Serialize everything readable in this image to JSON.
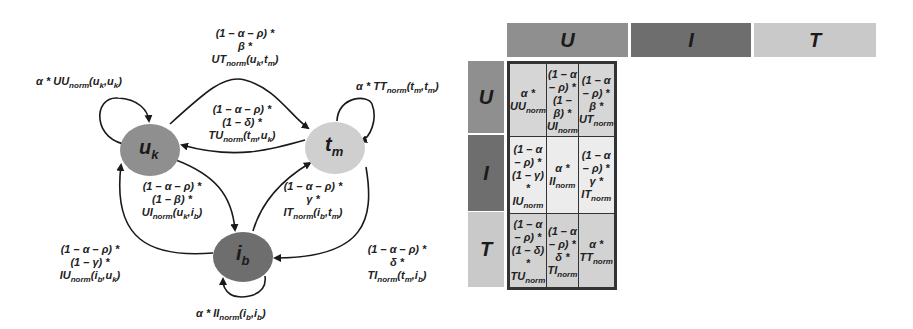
{
  "colors": {
    "U": "#8f8f8f",
    "I": "#6e6e6e",
    "T": "#c9c9c9",
    "row_U_bg": "#d6d6d6",
    "row_I_bg": "#ececec",
    "row_T_bg": "#d2d2d2"
  },
  "graph": {
    "nodes": [
      {
        "id": "uk",
        "base": "u",
        "sub": "k",
        "color": "#8f8f8f"
      },
      {
        "id": "tm",
        "base": "t",
        "sub": "m",
        "color": "#cfcfcf"
      },
      {
        "id": "ib",
        "base": "i",
        "sub": "b",
        "color": "#6e6e6e"
      }
    ],
    "edges": {
      "uu_self": {
        "lines": [
          "α * UU",
          "norm",
          "(u",
          "k",
          ",u",
          "k",
          ")"
        ]
      },
      "ut": {
        "line1": "(1 – α – ρ) *",
        "line2": "β *",
        "line3_base": "UT",
        "line3_sub": "norm",
        "line3_args": "(u",
        "a1": "k",
        "mid": ",t",
        "a2": "m",
        "end": ")"
      },
      "tu": {
        "line1": "(1 – α – ρ) *",
        "line2": "(1 – δ) *",
        "line3_base": "TU",
        "line3_sub": "norm",
        "line3_args": "(t",
        "a1": "m",
        "mid": ",u",
        "a2": "k",
        "end": ")"
      },
      "tt_self": {
        "pre": "α * TT",
        "sub": "norm",
        "args": "(t",
        "a1": "m",
        "mid": ",t",
        "a2": "m",
        "end": ")"
      },
      "ui": {
        "line1": "(1 – α – ρ) *",
        "line2": "(1 – β) *",
        "line3_base": "UI",
        "line3_sub": "norm",
        "line3_args": "(u",
        "a1": "k",
        "mid": ",i",
        "a2": "b",
        "end": ")"
      },
      "it": {
        "line1": "(1 – α – ρ) *",
        "line2": "γ *",
        "line3_base": "IT",
        "line3_sub": "norm",
        "line3_args": "(i",
        "a1": "b",
        "mid": ",t",
        "a2": "m",
        "end": ")"
      },
      "iu": {
        "line1": "(1 – α – ρ) *",
        "line2": "(1 – γ) *",
        "line3_base": "IU",
        "line3_sub": "norm",
        "line3_args": "(i",
        "a1": "b",
        "mid": ",u",
        "a2": "k",
        "end": ")"
      },
      "ti": {
        "line1": "(1 – α – ρ) *",
        "line2": "δ *",
        "line3_base": "TI",
        "line3_sub": "norm",
        "line3_args": "(t",
        "a1": "m",
        "mid": ",i",
        "a2": "b",
        "end": ")"
      },
      "ii_self": {
        "pre": "α * II",
        "sub": "norm",
        "args": "(i",
        "a1": "b",
        "mid": ",i",
        "a2": "b",
        "end": ")"
      }
    }
  },
  "matrix": {
    "col_headers": [
      "U",
      "I",
      "T"
    ],
    "row_headers": [
      "U",
      "I",
      "T"
    ],
    "cells": [
      [
        {
          "l1": "α * UU",
          "s1": "norm",
          "l2": "",
          "s2": ""
        },
        {
          "l1": "(1 – α – ρ) *",
          "s1": "",
          "l2": "(1 – β) * UI",
          "s2": "norm"
        },
        {
          "l1": "(1 – α – ρ) *",
          "s1": "",
          "l2": "β * UT",
          "s2": "norm"
        }
      ],
      [
        {
          "l1": "(1 – α – ρ) *",
          "s1": "",
          "l2": "(1 – γ) * IU",
          "s2": "norm"
        },
        {
          "l1": "α * II",
          "s1": "norm",
          "l2": "",
          "s2": ""
        },
        {
          "l1": "(1 – α – ρ) *",
          "s1": "",
          "l2": "γ * IT",
          "s2": "norm"
        }
      ],
      [
        {
          "l1": "(1 – α – ρ) *",
          "s1": "",
          "l2": "(1 – δ) * TU",
          "s2": "norm"
        },
        {
          "l1": "(1 – α – ρ) *",
          "s1": "",
          "l2": "δ * TI",
          "s2": "norm"
        },
        {
          "l1": "α * TT",
          "s1": "norm",
          "l2": "",
          "s2": ""
        }
      ]
    ]
  }
}
